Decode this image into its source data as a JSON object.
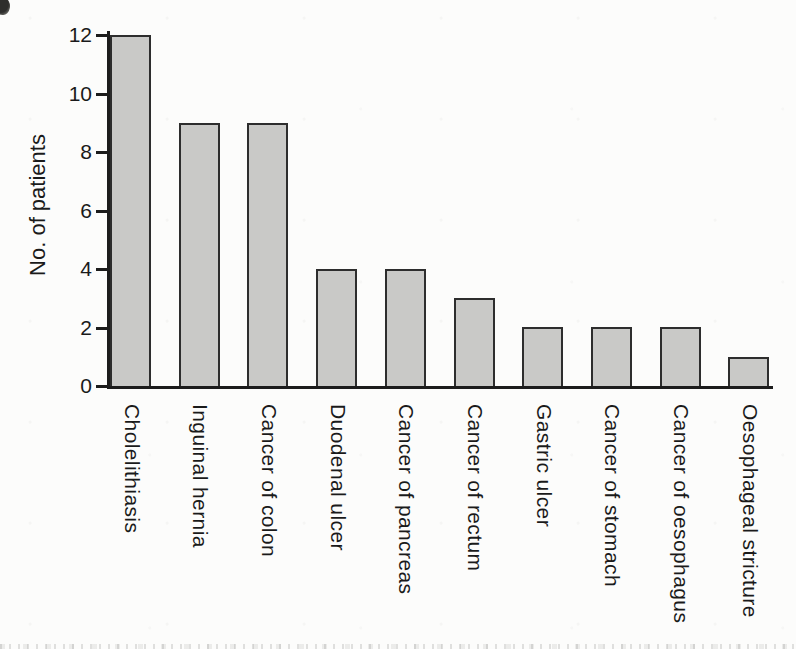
{
  "figure": {
    "background_color": "#fcfcfb",
    "bar_fill_color": "#c9c9c7",
    "bar_border_color": "#2d2d2d",
    "axis_color": "#1c1c1c",
    "text_color": "#1a1a1a"
  },
  "chart_data": {
    "type": "bar",
    "title": "",
    "xlabel": "",
    "ylabel": "No. of patients",
    "categories": [
      "Cholelithiasis",
      "Inguinal hernia",
      "Cancer of colon",
      "Duodenal ulcer",
      "Cancer of pancreas",
      "Cancer of rectum",
      "Gastric ulcer",
      "Cancer of stomach",
      "Cancer of oesophagus",
      "Oesophageal stricture"
    ],
    "values": [
      12,
      9,
      9,
      4,
      4,
      3,
      2,
      2,
      2,
      1
    ],
    "yticks": [
      0,
      2,
      4,
      6,
      8,
      10,
      12
    ],
    "ylim": [
      0,
      12
    ],
    "grid": false,
    "legend": "none",
    "bar_orientation": "vertical",
    "x_tick_label_rotation": 90,
    "y_label_rotation": -90
  }
}
